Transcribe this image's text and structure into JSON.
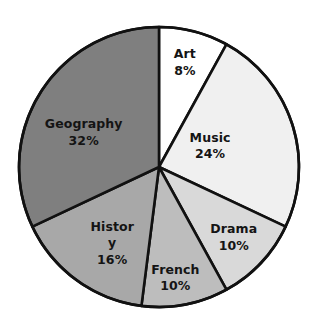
{
  "chart_data": {
    "type": "pie",
    "title": "",
    "subtitle": "",
    "xlabel": "",
    "ylabel": "",
    "legend_position": "none",
    "grid": false,
    "labels_inside_slices": true,
    "start_angle_deg": 0,
    "direction": "clockwise",
    "categories": [
      "Art",
      "Music",
      "Drama",
      "French",
      "History",
      "Geography"
    ],
    "values": [
      8,
      24,
      10,
      10,
      16,
      32
    ],
    "unit": "%",
    "total": 100,
    "colors": [
      "#ffffff",
      "#f0f0f0",
      "#d9d9d9",
      "#bdbdbd",
      "#a8a8a8",
      "#7f7f7f"
    ],
    "slices": [
      {
        "name": "Art",
        "value": 8,
        "value_text": "8%",
        "color": "#ffffff",
        "angle_deg": 28.8,
        "label_line1": "Art",
        "label_line2": "",
        "label_line3": "8%",
        "label_x_pct": 58.5,
        "label_y_pct": 19.0
      },
      {
        "name": "Music",
        "value": 24,
        "value_text": "24%",
        "color": "#f0f0f0",
        "angle_deg": 86.4,
        "label_line1": "Music",
        "label_line2": "",
        "label_line3": "24%",
        "label_x_pct": 66.5,
        "label_y_pct": 44.5
      },
      {
        "name": "Drama",
        "value": 10,
        "value_text": "10%",
        "color": "#d9d9d9",
        "angle_deg": 36.0,
        "label_line1": "Drama",
        "label_line2": "",
        "label_line3": "10%",
        "label_x_pct": 74.0,
        "label_y_pct": 72.5
      },
      {
        "name": "French",
        "value": 10,
        "value_text": "10%",
        "color": "#bdbdbd",
        "angle_deg": 36.0,
        "label_line1": "French",
        "label_line2": "",
        "label_line3": "10%",
        "label_x_pct": 55.5,
        "label_y_pct": 85.0
      },
      {
        "name": "History",
        "value": 16,
        "value_text": "16%",
        "color": "#a8a8a8",
        "angle_deg": 57.6,
        "label_line1": "Histor",
        "label_line2": "y",
        "label_line3": "16%",
        "label_x_pct": 35.5,
        "label_y_pct": 74.5
      },
      {
        "name": "Geography",
        "value": 32,
        "value_text": "32%",
        "color": "#7f7f7f",
        "angle_deg": 115.2,
        "label_line1": "Geography",
        "label_line2": "",
        "label_line3": "32%",
        "label_x_pct": 26.5,
        "label_y_pct": 40.5
      }
    ],
    "geometry": {
      "center_x": 159,
      "center_y": 167,
      "radius": 140,
      "stroke_color": "#111111",
      "stroke_width": 2.6,
      "background": "#ffffff"
    }
  }
}
